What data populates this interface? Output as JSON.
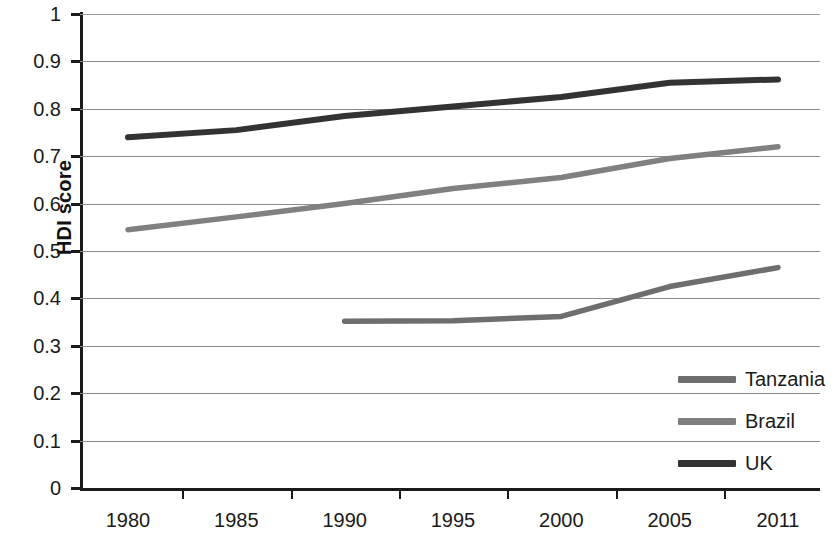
{
  "chart_data": {
    "type": "line",
    "title": "",
    "xlabel": "",
    "ylabel": "HDI score",
    "categories": [
      "1980",
      "1985",
      "1990",
      "1995",
      "2000",
      "2005",
      "2011"
    ],
    "ylim": [
      0,
      1
    ],
    "ytick_labels": [
      "1",
      "0.9",
      "0.8",
      "0.7",
      "0.6",
      "0.5",
      "0.4",
      "0.3",
      "0.2",
      "0.1",
      "0"
    ],
    "ytick_values": [
      1,
      0.9,
      0.8,
      0.7,
      0.6,
      0.5,
      0.4,
      0.3,
      0.2,
      0.1,
      0
    ],
    "grid": true,
    "legend_position": "inside-bottom-right",
    "series": [
      {
        "name": "Tanzania",
        "color": "#6e6e6e",
        "x": [
          "1990",
          "1995",
          "2000",
          "2005",
          "2011"
        ],
        "values": [
          0.352,
          0.353,
          0.362,
          0.425,
          0.465
        ]
      },
      {
        "name": "Brazil",
        "color": "#808080",
        "x": [
          "1980",
          "1985",
          "1990",
          "1995",
          "2000",
          "2005",
          "2011"
        ],
        "values": [
          0.545,
          0.572,
          0.6,
          0.632,
          0.655,
          0.695,
          0.72
        ]
      },
      {
        "name": "UK",
        "color": "#333333",
        "x": [
          "1980",
          "1985",
          "1990",
          "1995",
          "2000",
          "2005",
          "2011"
        ],
        "values": [
          0.74,
          0.755,
          0.785,
          0.805,
          0.825,
          0.855,
          0.862
        ]
      }
    ]
  },
  "axes": {
    "y_title": "HDI score"
  },
  "legend": {
    "items": [
      {
        "label": "Tanzania",
        "color": "#6e6e6e"
      },
      {
        "label": "Brazil",
        "color": "#808080"
      },
      {
        "label": "UK",
        "color": "#333333"
      }
    ]
  }
}
